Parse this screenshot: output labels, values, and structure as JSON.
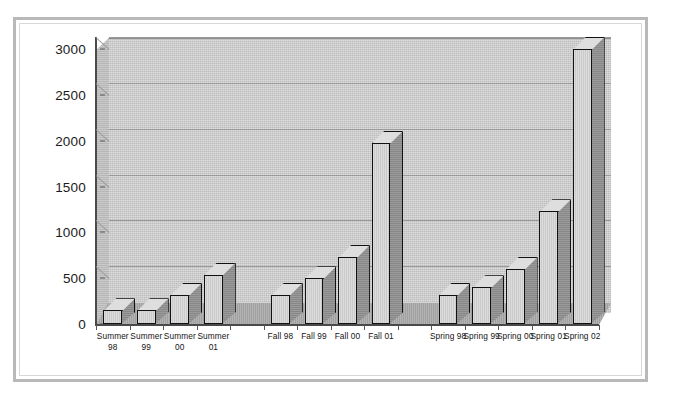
{
  "chart_data": {
    "type": "bar",
    "title": "",
    "subtitle": "",
    "xlabel": "",
    "ylabel": "",
    "ylim": [
      0,
      3000
    ],
    "ytick_labels": [
      "0",
      "500",
      "1000",
      "1500",
      "2000",
      "2500",
      "3000"
    ],
    "ytick_values": [
      0,
      500,
      1000,
      1500,
      2000,
      2500,
      3000
    ],
    "grid": true,
    "legend": "none",
    "style_3d": true,
    "categories": [
      "Summer\n98",
      "Summer\n99",
      "Summer\n00",
      "Summer\n01",
      "Fall 98",
      "Fall 99",
      "Fall 00",
      "Fall 01",
      "Spring 98",
      "Spring 99",
      "Spring 00",
      "Spring 01",
      "Spring 02"
    ],
    "values": [
      150,
      150,
      320,
      540,
      320,
      500,
      730,
      1980,
      320,
      400,
      600,
      1230,
      3000
    ],
    "groups": [
      {
        "name": "Summer",
        "labels": [
          "Summer\n98",
          "Summer\n99",
          "Summer\n00",
          "Summer\n01"
        ],
        "values": [
          150,
          150,
          320,
          540
        ]
      },
      {
        "name": "Fall",
        "labels": [
          "Fall 98",
          "Fall 99",
          "Fall 00",
          "Fall 01"
        ],
        "values": [
          320,
          500,
          730,
          1980
        ]
      },
      {
        "name": "Spring",
        "labels": [
          "Spring 98",
          "Spring 99",
          "Spring 00",
          "Spring 01",
          "Spring 02"
        ],
        "values": [
          320,
          400,
          600,
          1230,
          3000
        ]
      }
    ],
    "bars": [
      {
        "label": "Summer\n98",
        "value": 150
      },
      {
        "label": "Summer\n99",
        "value": 150
      },
      {
        "label": "Summer\n00",
        "value": 320
      },
      {
        "label": "Summer\n01",
        "value": 540
      },
      {
        "label": "Fall 98",
        "value": 320
      },
      {
        "label": "Fall 99",
        "value": 500
      },
      {
        "label": "Fall 00",
        "value": 730
      },
      {
        "label": "Fall 01",
        "value": 1980
      },
      {
        "label": "Spring 98",
        "value": 320
      },
      {
        "label": "Spring 99",
        "value": 400
      },
      {
        "label": "Spring 00",
        "value": 600
      },
      {
        "label": "Spring 01",
        "value": 1230
      },
      {
        "label": "Spring 02",
        "value": 3000
      }
    ],
    "colors": {
      "bar_front": "#cfcfcf",
      "bar_side": "#8f8f8f",
      "bar_top": "#dedede",
      "bar_outline": "#111111",
      "wall": "#c8c8c8",
      "floor": "#a9a9a9",
      "gridline": "#9a9a9a",
      "axis": "#4a4a4a",
      "frame": "#b9b9b9",
      "page": "#ffffff",
      "text": "#141414"
    }
  }
}
